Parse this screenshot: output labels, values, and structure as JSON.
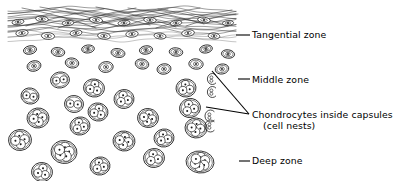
{
  "figure": {
    "background_color": "#ffffff",
    "ink_color": "#1a1a1a",
    "width": 403,
    "height": 181
  },
  "labels": {
    "tangential": "Tangential zone",
    "middle": "Middle zone",
    "chondrocytes_line1": "Chondrocytes inside capsules",
    "chondrocytes_line2": "(cell nests)",
    "deep": "Deep zone"
  },
  "leaders": {
    "tangential": {
      "type": "dash",
      "x1": 236,
      "y1": 35,
      "x2": 250,
      "y2": 35
    },
    "middle": {
      "type": "dash",
      "x1": 238,
      "y1": 79,
      "x2": 250,
      "y2": 79
    },
    "deep": {
      "type": "dash",
      "x1": 239,
      "y1": 161,
      "x2": 250,
      "y2": 161
    },
    "chondrocytes": {
      "type": "converging-v",
      "apex_x": 249,
      "apex_y": 114,
      "branch_a_x": 212,
      "branch_a_y": 71,
      "branch_b_x": 206,
      "branch_b_y": 107
    }
  },
  "zones": [
    {
      "name": "tangential",
      "label": "Tangential zone",
      "y_top": 6,
      "y_bottom": 42,
      "description": "Dense wavy collagen fibre bundles with flattened lens-shaped chondrocytes"
    },
    {
      "name": "middle",
      "label": "Middle zone",
      "y_top": 42,
      "y_bottom": 105,
      "description": "Scattered smaller rounded chondrocytes in capsules"
    },
    {
      "name": "deep",
      "label": "Deep zone",
      "y_top": 105,
      "y_bottom": 181,
      "description": "Large cell nests with 2 to 6 chondrocytes per capsule"
    }
  ],
  "fibers": [
    {
      "y": 9,
      "amp": 2.4,
      "phase": 0.2
    },
    {
      "y": 11,
      "amp": 3.0,
      "phase": 1.1
    },
    {
      "y": 13,
      "amp": 2.2,
      "phase": 2.3
    },
    {
      "y": 15,
      "amp": 3.2,
      "phase": 0.7
    },
    {
      "y": 17,
      "amp": 2.0,
      "phase": 3.1
    },
    {
      "y": 19,
      "amp": 2.8,
      "phase": 1.7
    },
    {
      "y": 21,
      "amp": 2.4,
      "phase": 2.9
    },
    {
      "y": 23,
      "amp": 3.0,
      "phase": 0.4
    },
    {
      "y": 25,
      "amp": 2.2,
      "phase": 1.9
    },
    {
      "y": 27,
      "amp": 2.6,
      "phase": 2.6
    },
    {
      "y": 29,
      "amp": 2.0,
      "phase": 0.9
    },
    {
      "y": 31,
      "amp": 2.8,
      "phase": 2.1
    },
    {
      "y": 33,
      "amp": 2.3,
      "phase": 3.4
    },
    {
      "y": 35,
      "amp": 2.6,
      "phase": 1.3
    },
    {
      "y": 37,
      "amp": 2.0,
      "phase": 2.7
    },
    {
      "y": 39,
      "amp": 2.4,
      "phase": 0.6
    }
  ],
  "crossing_fibers": [
    {
      "x1": 22,
      "y1": 8,
      "x2": 96,
      "y2": 28
    },
    {
      "x1": 40,
      "y1": 7,
      "x2": 118,
      "y2": 26
    },
    {
      "x1": 66,
      "y1": 9,
      "x2": 150,
      "y2": 25
    },
    {
      "x1": 96,
      "y1": 7,
      "x2": 176,
      "y2": 27
    },
    {
      "x1": 128,
      "y1": 8,
      "x2": 204,
      "y2": 24
    },
    {
      "x1": 158,
      "y1": 9,
      "x2": 228,
      "y2": 26
    },
    {
      "x1": 26,
      "y1": 26,
      "x2": 104,
      "y2": 9
    },
    {
      "x1": 58,
      "y1": 28,
      "x2": 136,
      "y2": 8
    },
    {
      "x1": 92,
      "y1": 27,
      "x2": 168,
      "y2": 9
    },
    {
      "x1": 124,
      "y1": 26,
      "x2": 200,
      "y2": 8
    },
    {
      "x1": 156,
      "y1": 28,
      "x2": 232,
      "y2": 10
    },
    {
      "x1": 186,
      "y1": 26,
      "x2": 238,
      "y2": 14
    }
  ],
  "flat_cells": [
    {
      "cx": 18,
      "cy": 22,
      "rx": 6.0,
      "ry": 2.6,
      "rot": -8
    },
    {
      "cx": 42,
      "cy": 19,
      "rx": 6.4,
      "ry": 2.8,
      "rot": 6
    },
    {
      "cx": 68,
      "cy": 23,
      "rx": 5.8,
      "ry": 2.6,
      "rot": -5
    },
    {
      "cx": 96,
      "cy": 20,
      "rx": 6.6,
      "ry": 3.0,
      "rot": 8
    },
    {
      "cx": 124,
      "cy": 23,
      "rx": 6.0,
      "ry": 2.6,
      "rot": -6
    },
    {
      "cx": 150,
      "cy": 20,
      "rx": 6.2,
      "ry": 2.8,
      "rot": 5
    },
    {
      "cx": 176,
      "cy": 23,
      "rx": 5.8,
      "ry": 2.6,
      "rot": -7
    },
    {
      "cx": 204,
      "cy": 20,
      "rx": 6.4,
      "ry": 2.8,
      "rot": 7
    },
    {
      "cx": 228,
      "cy": 23,
      "rx": 5.6,
      "ry": 2.4,
      "rot": -4
    },
    {
      "cx": 22,
      "cy": 33,
      "rx": 6.2,
      "ry": 3.2,
      "rot": -6
    },
    {
      "cx": 48,
      "cy": 36,
      "rx": 6.6,
      "ry": 3.4,
      "rot": 4
    },
    {
      "cx": 76,
      "cy": 33,
      "rx": 6.0,
      "ry": 3.0,
      "rot": -8
    },
    {
      "cx": 104,
      "cy": 36,
      "rx": 6.4,
      "ry": 3.2,
      "rot": 6
    },
    {
      "cx": 132,
      "cy": 34,
      "rx": 6.2,
      "ry": 3.2,
      "rot": -5
    },
    {
      "cx": 160,
      "cy": 36,
      "rx": 6.0,
      "ry": 3.0,
      "rot": 7
    },
    {
      "cx": 188,
      "cy": 33,
      "rx": 6.4,
      "ry": 3.2,
      "rot": -6
    },
    {
      "cx": 214,
      "cy": 36,
      "rx": 5.8,
      "ry": 3.0,
      "rot": 5
    }
  ],
  "single_cells": [
    {
      "cx": 30,
      "cy": 50,
      "rx": 6.6,
      "ry": 4.2,
      "rot": -12
    },
    {
      "cx": 58,
      "cy": 52,
      "rx": 6.8,
      "ry": 4.4,
      "rot": 8
    },
    {
      "cx": 88,
      "cy": 49,
      "rx": 6.4,
      "ry": 4.0,
      "rot": -6
    },
    {
      "cx": 118,
      "cy": 53,
      "rx": 7.0,
      "ry": 4.4,
      "rot": 10
    },
    {
      "cx": 146,
      "cy": 50,
      "rx": 6.6,
      "ry": 4.2,
      "rot": -8
    },
    {
      "cx": 176,
      "cy": 52,
      "rx": 6.8,
      "ry": 4.2,
      "rot": 6
    },
    {
      "cx": 206,
      "cy": 49,
      "rx": 6.4,
      "ry": 4.0,
      "rot": -10
    },
    {
      "cx": 228,
      "cy": 54,
      "rx": 6.6,
      "ry": 4.2,
      "rot": 7
    },
    {
      "cx": 34,
      "cy": 66,
      "rx": 7.0,
      "ry": 5.2,
      "rot": -14
    },
    {
      "cx": 72,
      "cy": 63,
      "rx": 6.8,
      "ry": 5.0,
      "rot": 9
    },
    {
      "cx": 106,
      "cy": 67,
      "rx": 7.2,
      "ry": 5.4,
      "rot": -7
    },
    {
      "cx": 142,
      "cy": 64,
      "rx": 6.8,
      "ry": 5.0,
      "rot": 12
    },
    {
      "cx": 164,
      "cy": 69,
      "rx": 7.0,
      "ry": 5.2,
      "rot": -9
    },
    {
      "cx": 196,
      "cy": 64,
      "rx": 7.2,
      "ry": 5.2,
      "rot": 6
    },
    {
      "cx": 222,
      "cy": 69,
      "rx": 6.8,
      "ry": 5.0,
      "rot": -11
    }
  ],
  "nests": [
    {
      "cx": 60,
      "cy": 80,
      "rx": 9.5,
      "ry": 8.0,
      "rot": -10,
      "cells": 2
    },
    {
      "cx": 94,
      "cy": 88,
      "rx": 10.5,
      "ry": 9.0,
      "rot": 8,
      "cells": 3
    },
    {
      "cx": 186,
      "cy": 88,
      "rx": 10.0,
      "ry": 9.0,
      "rot": -6,
      "cells": 3
    },
    {
      "cx": 30,
      "cy": 96,
      "rx": 9.0,
      "ry": 8.0,
      "rot": 12,
      "cells": 2
    },
    {
      "cx": 124,
      "cy": 99,
      "rx": 10.0,
      "ry": 9.5,
      "rot": -8,
      "cells": 3
    },
    {
      "cx": 74,
      "cy": 104,
      "rx": 9.5,
      "ry": 8.5,
      "rot": 6,
      "cells": 2
    },
    {
      "cx": 190,
      "cy": 108,
      "rx": 10.5,
      "ry": 9.5,
      "rot": -12,
      "cells": 3
    },
    {
      "cx": 98,
      "cy": 112,
      "rx": 10.0,
      "ry": 9.0,
      "rot": 10,
      "cells": 3
    },
    {
      "cx": 38,
      "cy": 118,
      "rx": 11.0,
      "ry": 10.0,
      "rot": -7,
      "cells": 4
    },
    {
      "cx": 148,
      "cy": 118,
      "rx": 10.5,
      "ry": 9.5,
      "rot": 9,
      "cells": 4
    },
    {
      "cx": 80,
      "cy": 126,
      "rx": 10.0,
      "ry": 9.0,
      "rot": -11,
      "cells": 3
    },
    {
      "cx": 196,
      "cy": 128,
      "rx": 11.0,
      "ry": 10.0,
      "rot": 5,
      "cells": 4
    },
    {
      "cx": 20,
      "cy": 140,
      "rx": 11.5,
      "ry": 10.5,
      "rot": -6,
      "cells": 4
    },
    {
      "cx": 124,
      "cy": 141,
      "rx": 11.0,
      "ry": 10.0,
      "rot": 8,
      "cells": 4
    },
    {
      "cx": 164,
      "cy": 138,
      "rx": 10.0,
      "ry": 9.0,
      "rot": -9,
      "cells": 3
    },
    {
      "cx": 64,
      "cy": 152,
      "rx": 13.0,
      "ry": 11.5,
      "rot": 7,
      "cells": 5
    },
    {
      "cx": 154,
      "cy": 158,
      "rx": 10.5,
      "ry": 9.5,
      "rot": -8,
      "cells": 3
    },
    {
      "cx": 200,
      "cy": 162,
      "rx": 14.0,
      "ry": 11.0,
      "rot": 6,
      "cells": 6
    },
    {
      "cx": 100,
      "cy": 166,
      "rx": 10.0,
      "ry": 9.0,
      "rot": -10,
      "cells": 3
    },
    {
      "cx": 42,
      "cy": 172,
      "rx": 10.5,
      "ry": 9.5,
      "rot": 9,
      "cells": 3
    }
  ],
  "marker_cells": [
    {
      "cx": 212,
      "cy": 79,
      "rx": 5.0,
      "ry": 5.5,
      "rot": 0
    },
    {
      "cx": 212,
      "cy": 92,
      "rx": 5.0,
      "ry": 5.5,
      "rot": 0
    },
    {
      "cx": 210,
      "cy": 116,
      "rx": 5.5,
      "ry": 6.0,
      "rot": 0
    },
    {
      "cx": 210,
      "cy": 126,
      "rx": 5.5,
      "ry": 6.0,
      "rot": 0
    }
  ]
}
